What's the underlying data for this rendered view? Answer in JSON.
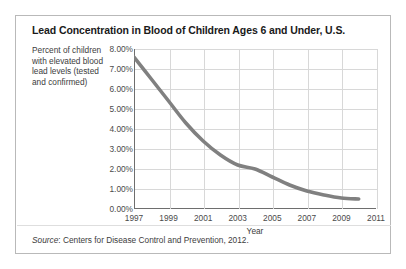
{
  "figure": {
    "title": "Lead Concentration in Blood of Children Ages 6 and Under, U.S.",
    "axis_caption": "Percent of children with elevated blood lead levels (tested and confirmed)",
    "source_prefix": "Source",
    "source_text": ": Centers for Disease Control and Prevention, 2012.",
    "line_color": "#808080",
    "grid_color": "#d8d8d8",
    "axis_color": "#6e6e6e"
  },
  "chart_data": {
    "type": "line",
    "title": "Lead Concentration in Blood of Children Ages 6 and Under, U.S.",
    "xlabel": "Year",
    "ylabel": "Percent of children with elevated blood lead levels (tested and confirmed)",
    "xlim": [
      1997,
      2011
    ],
    "ylim": [
      0,
      8
    ],
    "grid": true,
    "legend": "none",
    "ytick_labels": [
      "8.00%",
      "7.00%",
      "6.00%",
      "5.00%",
      "4.00%",
      "3.00%",
      "2.00%",
      "1.00%",
      "0.00%"
    ],
    "ytick_values": [
      8,
      7,
      6,
      5,
      4,
      3,
      2,
      1,
      0
    ],
    "xtick_labels": [
      "1997",
      "1999",
      "2001",
      "2003",
      "2005",
      "2007",
      "2009",
      "2011"
    ],
    "xtick_values": [
      1997,
      1999,
      2001,
      2003,
      2005,
      2007,
      2009,
      2011
    ],
    "x": [
      1997,
      1998,
      1999,
      2000,
      2001,
      2002,
      2003,
      2004,
      2005,
      2006,
      2007,
      2008,
      2009,
      2010
    ],
    "values": [
      7.6,
      6.5,
      5.4,
      4.3,
      3.4,
      2.7,
      2.2,
      2.0,
      1.6,
      1.2,
      0.9,
      0.7,
      0.55,
      0.5
    ],
    "series": [
      {
        "name": "Percent of children with elevated blood lead levels",
        "values": [
          7.6,
          6.5,
          5.4,
          4.3,
          3.4,
          2.7,
          2.2,
          2.0,
          1.6,
          1.2,
          0.9,
          0.7,
          0.55,
          0.5
        ]
      }
    ]
  }
}
